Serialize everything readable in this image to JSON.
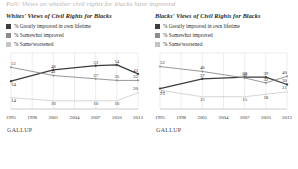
{
  "page": {
    "clipped_header": "Poll: Views on whether civil rights for blacks have improved"
  },
  "colors": {
    "series_greatly": "#3d3d3d",
    "series_somewhat": "#8c8c8c",
    "series_same": "#c4c4c4",
    "grid": "#d2d2d2",
    "axis": "#9a9a9a"
  },
  "panels": [
    {
      "id": "whites",
      "title": "Whites' Views of Civil Rights for Blacks",
      "source": "GALLUP",
      "legend": [
        {
          "label": "% Greatly improved in own lifetime",
          "color": "#3d3d3d"
        },
        {
          "label": "% Somewhat improved",
          "color": "#8c8c8c"
        },
        {
          "label": "% Same/worsened",
          "color": "#c4c4c4"
        }
      ],
      "years": [
        "1995",
        "1998",
        "2001",
        "2004",
        "2007",
        "2010",
        "2013"
      ]
    },
    {
      "id": "blacks",
      "title": "Blacks' Views of Civil Rights for Blacks",
      "source": "GALLUP",
      "legend": [
        {
          "label": "% Greatly improved in own lifetime",
          "color": "#3d3d3d"
        },
        {
          "label": "% Somewhat improved",
          "color": "#8c8c8c"
        },
        {
          "label": "% Same/worsened",
          "color": "#c4c4c4"
        }
      ],
      "years": [
        "1995",
        "1998",
        "2001",
        "2004",
        "2007",
        "2010",
        "2013"
      ]
    }
  ],
  "chart_data": [
    {
      "type": "line",
      "title": "Whites' Views of Civil Rights for Blacks",
      "xlabel": "",
      "ylabel": "",
      "categories": [
        "1995",
        "1998",
        "2001",
        "2004",
        "2007",
        "2010",
        "2013"
      ],
      "ylim": [
        0,
        60
      ],
      "grid": true,
      "legend_position": "above",
      "source": "GALLUP",
      "series": [
        {
          "name": "% Greatly improved in own lifetime",
          "color": "#3d3d3d",
          "values": [
            34,
            null,
            48,
            null,
            53,
            54,
            43
          ],
          "labels": [
            "34",
            "",
            "48",
            "",
            "53",
            "54",
            "43"
          ]
        },
        {
          "name": "% Somewhat improved",
          "color": "#8c8c8c",
          "values": [
            51,
            null,
            41,
            null,
            37,
            35,
            35
          ],
          "labels": [
            "51",
            "",
            "41",
            "",
            "37",
            "35",
            "35"
          ]
        },
        {
          "name": "% Same/worsened",
          "color": "#c4c4c4",
          "values": [
            14,
            null,
            10,
            null,
            10,
            10,
            20
          ],
          "labels": [
            "14",
            "",
            "10",
            "",
            "10",
            "10",
            "20"
          ]
        }
      ]
    },
    {
      "type": "line",
      "title": "Blacks' Views of Civil Rights for Blacks",
      "xlabel": "",
      "ylabel": "",
      "categories": [
        "1995",
        "1998",
        "2001",
        "2004",
        "2007",
        "2010",
        "2013"
      ],
      "ylim": [
        0,
        60
      ],
      "grid": true,
      "legend_position": "above",
      "source": "GALLUP",
      "series": [
        {
          "name": "% Greatly improved in own lifetime",
          "color": "#3d3d3d",
          "values": [
            25,
            null,
            37,
            null,
            39,
            39,
            30
          ],
          "labels": [
            "25",
            "",
            "37",
            "",
            "39",
            "39",
            "30"
          ]
        },
        {
          "name": "% Somewhat improved",
          "color": "#8c8c8c",
          "values": [
            52,
            null,
            46,
            null,
            38,
            32,
            40
          ],
          "labels": [
            "52",
            "",
            "46",
            "",
            "38",
            "32",
            "40"
          ]
        },
        {
          "name": "% Same/worsened",
          "color": "#c4c4c4",
          "values": [
            23,
            null,
            15,
            null,
            15,
            18,
            21
          ],
          "labels": [
            "23",
            "",
            "15",
            "",
            "15",
            "18",
            "21"
          ]
        }
      ]
    }
  ]
}
